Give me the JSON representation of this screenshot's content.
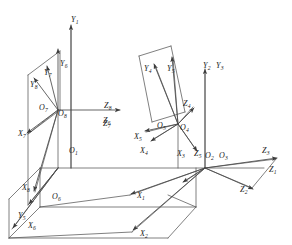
{
  "diagram": {
    "type": "technical-line-drawing",
    "stroke_color": "#4a4a4a",
    "label_color": "#1a1a1a",
    "background_color": "#ffffff",
    "width": 292,
    "height": 245,
    "frame_count": 8,
    "origins": [
      {
        "name": "O1",
        "base": "O",
        "sub": "1",
        "x": 69,
        "y": 147
      },
      {
        "name": "O2",
        "base": "O",
        "sub": "2",
        "x": 205,
        "y": 152
      },
      {
        "name": "O3",
        "base": "O",
        "sub": "3",
        "x": 219,
        "y": 152
      },
      {
        "name": "O4",
        "base": "O",
        "sub": "4",
        "x": 180,
        "y": 124
      },
      {
        "name": "O5",
        "base": "O",
        "sub": "5",
        "x": 157,
        "y": 122
      },
      {
        "name": "O6",
        "base": "O",
        "sub": "6",
        "x": 52,
        "y": 193
      },
      {
        "name": "O7",
        "base": "O",
        "sub": "7",
        "x": 39,
        "y": 104
      },
      {
        "name": "O8",
        "base": "O",
        "sub": "8",
        "x": 58,
        "y": 110
      }
    ],
    "axis_labels": [
      {
        "name": "Y1",
        "base": "Y",
        "sub": "1",
        "x": 71,
        "y": 16
      },
      {
        "name": "Y2",
        "base": "Y",
        "sub": "2",
        "x": 203,
        "y": 62
      },
      {
        "name": "Y3",
        "base": "Y",
        "sub": "3",
        "x": 216,
        "y": 62
      },
      {
        "name": "Y4",
        "base": "Y",
        "sub": "4",
        "x": 144,
        "y": 65
      },
      {
        "name": "Y5",
        "base": "Y",
        "sub": "5",
        "x": 167,
        "y": 65
      },
      {
        "name": "Y6",
        "base": "Y",
        "sub": "6",
        "x": 60,
        "y": 60
      },
      {
        "name": "Y7",
        "base": "Y",
        "sub": "7",
        "x": 44,
        "y": 69
      },
      {
        "name": "Y8",
        "base": "Y",
        "sub": "8",
        "x": 30,
        "y": 81
      },
      {
        "name": "Y5b",
        "base": "Y",
        "sub": "5",
        "x": 18,
        "y": 212
      },
      {
        "name": "X1",
        "base": "X",
        "sub": "1",
        "x": 137,
        "y": 192
      },
      {
        "name": "X2",
        "base": "X",
        "sub": "2",
        "x": 140,
        "y": 230
      },
      {
        "name": "X3",
        "base": "X",
        "sub": "3",
        "x": 177,
        "y": 150
      },
      {
        "name": "X4",
        "base": "X",
        "sub": "4",
        "x": 140,
        "y": 147
      },
      {
        "name": "X5",
        "base": "X",
        "sub": "5",
        "x": 134,
        "y": 133
      },
      {
        "name": "X6",
        "base": "X",
        "sub": "6",
        "x": 28,
        "y": 222
      },
      {
        "name": "X7",
        "base": "X",
        "sub": "7",
        "x": 18,
        "y": 130
      },
      {
        "name": "X8",
        "base": "X",
        "sub": "8",
        "x": 22,
        "y": 184
      },
      {
        "name": "Z1",
        "base": "Z",
        "sub": "1",
        "x": 269,
        "y": 166
      },
      {
        "name": "Z2",
        "base": "Z",
        "sub": "2",
        "x": 240,
        "y": 186
      },
      {
        "name": "Z3",
        "base": "Z",
        "sub": "3",
        "x": 262,
        "y": 147
      },
      {
        "name": "Z4",
        "base": "Z",
        "sub": "4",
        "x": 183,
        "y": 100
      },
      {
        "name": "Z5",
        "base": "Z",
        "sub": "5",
        "x": 194,
        "y": 150
      },
      {
        "name": "Z6",
        "base": "Z",
        "sub": "6",
        "x": 103,
        "y": 117
      },
      {
        "name": "Z7",
        "base": "Z",
        "sub": "7",
        "x": 103,
        "y": 120
      },
      {
        "name": "Z8",
        "base": "Z",
        "sub": "8",
        "x": 104,
        "y": 102
      }
    ]
  }
}
